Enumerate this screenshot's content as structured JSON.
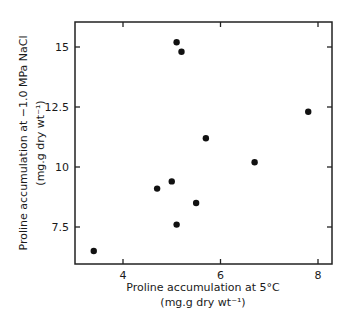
{
  "chart_data": {
    "type": "scatter",
    "title": "",
    "xlabel": "Proline accumulation at 5°C",
    "xlabel_units": "(mg.g dry wt⁻¹)",
    "ylabel": "Proline accumulation at −1.0 MPa NaCl",
    "ylabel_units": "(mg.g dry wt⁻¹)",
    "xlim": [
      3.0,
      8.3
    ],
    "ylim": [
      6.1,
      16.0
    ],
    "xticks": [
      4,
      6,
      8
    ],
    "xtick_labels": [
      "4",
      "6",
      "8"
    ],
    "yticks": [
      7.5,
      10,
      12.5,
      15
    ],
    "ytick_labels": [
      "7.5",
      "10",
      "12.5",
      "15"
    ],
    "grid": false,
    "legend": null,
    "points": [
      {
        "x": 3.4,
        "y": 6.5
      },
      {
        "x": 4.7,
        "y": 9.1
      },
      {
        "x": 5.0,
        "y": 9.4
      },
      {
        "x": 5.1,
        "y": 15.2
      },
      {
        "x": 5.2,
        "y": 14.8
      },
      {
        "x": 5.1,
        "y": 7.6
      },
      {
        "x": 5.5,
        "y": 8.5
      },
      {
        "x": 5.7,
        "y": 11.2
      },
      {
        "x": 6.7,
        "y": 10.2
      },
      {
        "x": 7.8,
        "y": 12.3
      }
    ],
    "marker_color": "#111111"
  }
}
